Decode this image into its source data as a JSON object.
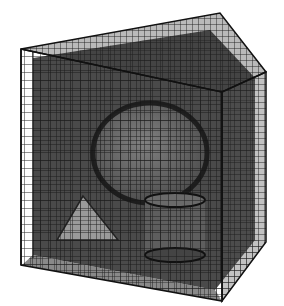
{
  "figure": {
    "background": "#ffffff",
    "colors": {
      "grid_line": "#1a1a1a",
      "back_fill": "#4a4a4a",
      "top_fill": "#3a3a3a",
      "right_fill": "#505050",
      "sphere_fill": "#6e6e6e",
      "pyramid_fill": "#9a9a9a",
      "cylinder_fill": "#5e5e5e"
    },
    "objects": [
      {
        "name": "outer-cube-grid"
      },
      {
        "name": "sphere"
      },
      {
        "name": "pyramid"
      },
      {
        "name": "cylinder"
      }
    ]
  }
}
